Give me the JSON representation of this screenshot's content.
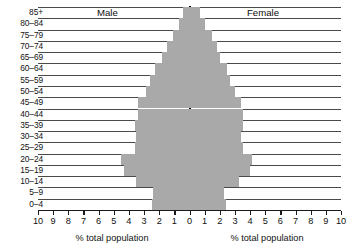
{
  "chart_data": {
    "type": "bar",
    "subtype": "population-pyramid",
    "title": "",
    "xlabel_left": "% total population",
    "xlabel_right": "% total population",
    "ylabel": "",
    "categories": [
      "0–4",
      "5–9",
      "10–14",
      "15–19",
      "20–24",
      "25–29",
      "30–34",
      "35–39",
      "40–44",
      "45–49",
      "50–54",
      "55–59",
      "60–64",
      "65–69",
      "70–74",
      "75–79",
      "80–84",
      "85+"
    ],
    "series": [
      {
        "name": "Male",
        "values": [
          2.5,
          2.4,
          3.5,
          4.3,
          4.5,
          3.6,
          3.5,
          3.6,
          3.4,
          3.4,
          2.9,
          2.6,
          2.3,
          1.8,
          1.5,
          1.1,
          0.7,
          0.4
        ]
      },
      {
        "name": "Female",
        "values": [
          2.4,
          2.3,
          3.3,
          4.0,
          4.1,
          3.5,
          3.4,
          3.5,
          3.5,
          3.4,
          3.0,
          2.7,
          2.5,
          2.0,
          1.8,
          1.5,
          1.0,
          0.7
        ]
      }
    ],
    "tick_labels_left": [
      "10",
      "9",
      "8",
      "7",
      "6",
      "5",
      "4",
      "3",
      "2",
      "1"
    ],
    "tick_labels_center": "0",
    "tick_labels_right": [
      "1",
      "2",
      "3",
      "4",
      "5",
      "6",
      "7",
      "8",
      "9",
      "10"
    ],
    "xlim": [
      -10,
      10
    ],
    "tick_step": 1,
    "grid": true,
    "legend_position": "in-plot-top",
    "bar_color": "#a9a9a9",
    "axis_color": "#1a1a1a",
    "gridline_color": "#4a4a4a"
  }
}
